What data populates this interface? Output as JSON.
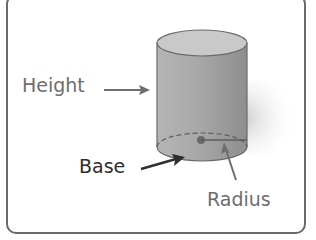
{
  "diagram": {
    "labels": {
      "height": "Height",
      "base": "Base",
      "radius": "Radius"
    },
    "colors": {
      "frame": "#6a6a6a",
      "cylinder_body": "#a9a9a9",
      "cylinder_top": "#c8c8c8",
      "label_gray": "#6e6e6e",
      "label_dark": "#2e2e2e",
      "arrow_dark": "#2e2e2e",
      "arrow_gray": "#6e6e6e"
    }
  }
}
